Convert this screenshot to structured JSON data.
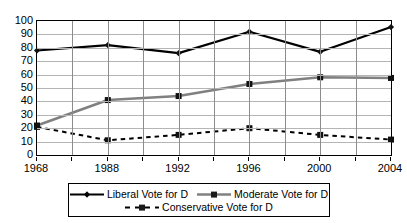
{
  "chart_data": {
    "type": "line",
    "title": "",
    "xlabel": "",
    "ylabel": "",
    "ylim": [
      0,
      100
    ],
    "ytick_step": 10,
    "grid": true,
    "legend_position": "bottom",
    "categories": [
      "1968",
      "1988",
      "1992",
      "1996",
      "2000",
      "2004"
    ],
    "yticks": [
      "0",
      "10",
      "20",
      "30",
      "40",
      "50",
      "60",
      "70",
      "80",
      "90",
      "100"
    ],
    "series": [
      {
        "name": "Liberal Vote for D",
        "color": "#000000",
        "style": "solid",
        "marker": "diamond",
        "values": [
          78,
          82,
          76,
          92,
          77,
          95.5
        ]
      },
      {
        "name": "Moderate Vote for D",
        "color": "#808080",
        "style": "solid",
        "marker": "square",
        "values": [
          22,
          41,
          44,
          53,
          58,
          57.5
        ]
      },
      {
        "name": "Conservative Vote for D",
        "color": "#000000",
        "style": "dashed",
        "marker": "square",
        "values": [
          21,
          11,
          15,
          20,
          15,
          11.5
        ]
      }
    ]
  },
  "legend": {
    "rows": [
      [
        "Liberal Vote for D",
        "Moderate Vote for D"
      ],
      [
        "Conservative Vote for D"
      ]
    ]
  }
}
